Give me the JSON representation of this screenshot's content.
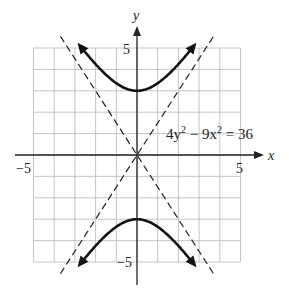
{
  "chart_data": {
    "type": "line",
    "title": "",
    "equation": "4y² − 9x² = 36",
    "xlabel": "x",
    "ylabel": "y",
    "xlim": [
      -5,
      5
    ],
    "ylim": [
      -5,
      5
    ],
    "grid": true,
    "x_tick_labels": [
      "-5",
      "5"
    ],
    "y_tick_labels": [
      "5",
      "-5"
    ],
    "series": [
      {
        "name": "upper branch",
        "style": "solid",
        "x": [
          -2.9,
          -2,
          -1,
          0,
          1,
          2,
          2.9
        ],
        "y": [
          5.22,
          4.24,
          3.35,
          3,
          3.35,
          4.24,
          5.22
        ]
      },
      {
        "name": "lower branch",
        "style": "solid",
        "x": [
          -2.9,
          -2,
          -1,
          0,
          1,
          2,
          2.9
        ],
        "y": [
          -5.22,
          -4.24,
          -3.35,
          -3,
          -3.35,
          -4.24,
          -5.22
        ]
      },
      {
        "name": "asymptote y = 1.5x",
        "style": "dashed",
        "x": [
          -3.7,
          3.7
        ],
        "y": [
          -5.55,
          5.55
        ]
      },
      {
        "name": "asymptote y = -1.5x",
        "style": "dashed",
        "x": [
          -3.7,
          3.7
        ],
        "y": [
          5.55,
          -5.55
        ]
      }
    ]
  },
  "labels": {
    "x_axis": "x",
    "y_axis": "y",
    "x_min": "−5",
    "x_max": "5",
    "y_max": "5",
    "y_min": "−5",
    "equation_lhs": "4y",
    "equation_exp1": "2",
    "equation_mid": " − 9x",
    "equation_exp2": "2",
    "equation_rhs": " = 36"
  }
}
